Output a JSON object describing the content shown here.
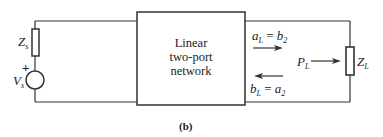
{
  "figure": {
    "caption": "(b)",
    "network_label_lines": [
      "Linear",
      "two-port",
      "network"
    ]
  },
  "source": {
    "impedance_label": "Z",
    "impedance_sub": "s",
    "voltage_label": "V",
    "voltage_sub": "s",
    "polarity": "+"
  },
  "load": {
    "impedance_label": "Z",
    "impedance_sub": "L",
    "power_label": "P",
    "power_sub": "L"
  },
  "waves": {
    "incident": {
      "lhs": "a",
      "lhs_sub": "L",
      "eq": " = ",
      "rhs": "b",
      "rhs_sub": "2"
    },
    "reflected": {
      "lhs": "b",
      "lhs_sub": "L",
      "eq": " = ",
      "rhs": "a",
      "rhs_sub": "2"
    }
  },
  "colors": {
    "stroke": "#333333",
    "text": "#222222"
  }
}
